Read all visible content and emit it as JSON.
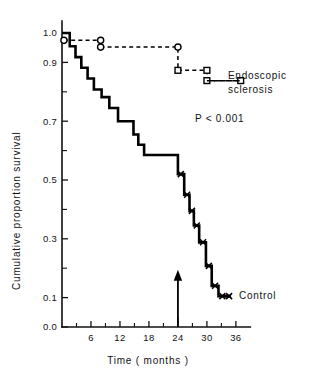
{
  "chart_data": {
    "type": "line",
    "title": "",
    "subtitle": "",
    "xlabel": "Time ( months )",
    "ylabel": "Cumulative proportion survival",
    "xlim": [
      0,
      39
    ],
    "ylim": [
      0.0,
      1.02
    ],
    "grid": false,
    "legend_position": "right-inside",
    "x_ticks_major": [
      6,
      12,
      18,
      24,
      30,
      36
    ],
    "x_tick_labels": [
      "6",
      "12",
      "18",
      "24",
      "30",
      "36"
    ],
    "x_ticks_minor": [
      3,
      9,
      15,
      21,
      27,
      33
    ],
    "y_ticks_major": [
      0.0,
      0.1,
      0.3,
      0.5,
      0.7,
      0.9,
      1.0
    ],
    "y_tick_labels": [
      "0.0",
      "0.1",
      "0.3",
      "0.5",
      "0.7",
      "0.9",
      "1.0"
    ],
    "y_ticks_minor": [
      0.2,
      0.4,
      0.6,
      0.8
    ],
    "annotations": [
      {
        "name": "p-value",
        "text": "P < 0.001",
        "x": 26.0,
        "y": 0.735
      },
      {
        "name": "followup-arrow",
        "text": "",
        "x": 24,
        "y_from": 0.0,
        "y_to": 0.195
      }
    ],
    "series": [
      {
        "name": "Endoscopic sclerosis",
        "label": "Endoscopic sclerosis",
        "line_style": "dashed",
        "marker": "open-circle-then-open-square",
        "legend_label_line1": "Endoscopic",
        "legend_label_line2": "sclerosis",
        "points": [
          {
            "x": 0.4,
            "y": 0.975
          },
          {
            "x": 8.0,
            "y": 0.975
          },
          {
            "x": 8.0,
            "y": 0.952
          },
          {
            "x": 24.0,
            "y": 0.952
          },
          {
            "x": 24.0,
            "y": 0.873
          },
          {
            "x": 30.0,
            "y": 0.873
          },
          {
            "x": 30.0,
            "y": 0.838
          },
          {
            "x": 37.0,
            "y": 0.838
          }
        ],
        "markers": [
          {
            "x": 0.4,
            "y": 0.975,
            "shape": "circle"
          },
          {
            "x": 8.0,
            "y": 0.975,
            "shape": "circle"
          },
          {
            "x": 8.0,
            "y": 0.952,
            "shape": "circle"
          },
          {
            "x": 24.0,
            "y": 0.952,
            "shape": "circle"
          },
          {
            "x": 24.0,
            "y": 0.873,
            "shape": "square"
          },
          {
            "x": 30.0,
            "y": 0.873,
            "shape": "square"
          },
          {
            "x": 30.0,
            "y": 0.838,
            "shape": "square"
          },
          {
            "x": 37.0,
            "y": 0.838,
            "shape": "square"
          }
        ]
      },
      {
        "name": "Control",
        "label": "Control",
        "line_style": "solid",
        "marker": "censor-x",
        "legend_label_line1": "Control",
        "points": [
          {
            "x": 0.0,
            "y": 1.0
          },
          {
            "x": 1.6,
            "y": 1.0
          },
          {
            "x": 1.6,
            "y": 0.955
          },
          {
            "x": 2.8,
            "y": 0.955
          },
          {
            "x": 2.8,
            "y": 0.918
          },
          {
            "x": 4.0,
            "y": 0.918
          },
          {
            "x": 4.0,
            "y": 0.882
          },
          {
            "x": 5.3,
            "y": 0.882
          },
          {
            "x": 5.3,
            "y": 0.845
          },
          {
            "x": 6.6,
            "y": 0.845
          },
          {
            "x": 6.6,
            "y": 0.808
          },
          {
            "x": 8.2,
            "y": 0.808
          },
          {
            "x": 8.2,
            "y": 0.782
          },
          {
            "x": 9.8,
            "y": 0.782
          },
          {
            "x": 9.8,
            "y": 0.745
          },
          {
            "x": 11.6,
            "y": 0.745
          },
          {
            "x": 11.6,
            "y": 0.7
          },
          {
            "x": 14.8,
            "y": 0.7
          },
          {
            "x": 14.8,
            "y": 0.655
          },
          {
            "x": 15.8,
            "y": 0.655
          },
          {
            "x": 15.8,
            "y": 0.62
          },
          {
            "x": 17.0,
            "y": 0.62
          },
          {
            "x": 17.0,
            "y": 0.585
          },
          {
            "x": 24.0,
            "y": 0.585
          },
          {
            "x": 24.0,
            "y": 0.52
          },
          {
            "x": 25.3,
            "y": 0.52
          },
          {
            "x": 25.3,
            "y": 0.45
          },
          {
            "x": 26.4,
            "y": 0.45
          },
          {
            "x": 26.4,
            "y": 0.395
          },
          {
            "x": 27.3,
            "y": 0.395
          },
          {
            "x": 27.3,
            "y": 0.345
          },
          {
            "x": 28.4,
            "y": 0.345
          },
          {
            "x": 28.4,
            "y": 0.288
          },
          {
            "x": 29.8,
            "y": 0.288
          },
          {
            "x": 29.8,
            "y": 0.208
          },
          {
            "x": 31.0,
            "y": 0.208
          },
          {
            "x": 31.0,
            "y": 0.14
          },
          {
            "x": 32.4,
            "y": 0.14
          },
          {
            "x": 32.4,
            "y": 0.105
          },
          {
            "x": 35.0,
            "y": 0.105
          }
        ],
        "censor_marks": [
          {
            "x": 24.6,
            "y": 0.52
          },
          {
            "x": 25.9,
            "y": 0.45
          },
          {
            "x": 26.9,
            "y": 0.395
          },
          {
            "x": 27.9,
            "y": 0.345
          },
          {
            "x": 29.2,
            "y": 0.288
          },
          {
            "x": 30.4,
            "y": 0.208
          },
          {
            "x": 31.7,
            "y": 0.14
          },
          {
            "x": 33.2,
            "y": 0.105
          },
          {
            "x": 34.6,
            "y": 0.105
          }
        ]
      }
    ]
  },
  "axes": {
    "y_title": "Cumulative proportion survival",
    "x_title": "Time ( months )",
    "y_labels": [
      "1.0",
      "0.9",
      "0.7",
      "0.5",
      "0.3",
      "0.1",
      "0.0"
    ],
    "x_labels": [
      "6",
      "12",
      "18",
      "24",
      "30",
      "36"
    ]
  },
  "legend": {
    "endoscopic_line1": "Endoscopic",
    "endoscopic_line2": "sclerosis",
    "control": "Control"
  },
  "stats": {
    "p_value": "P < 0.001"
  },
  "colors": {
    "ink": "#111111",
    "background": "#ffffff"
  }
}
